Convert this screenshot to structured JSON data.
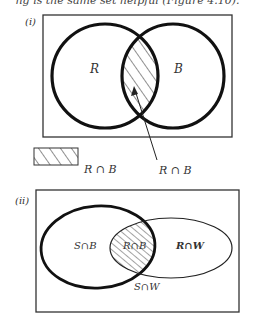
{
  "caption": "ng is the same set helpful (Figure 4.10).",
  "diagram_i": {
    "label": "(i)",
    "set_left_label": "R",
    "set_right_label": "B",
    "legend_label": "R ∩ B",
    "arrow_label": "R ∩ B"
  },
  "diagram_ii": {
    "label": "(ii)",
    "region_left_label": "S∩B",
    "region_center_label": "R∩B",
    "region_right_label": "R∩W",
    "region_bottom_label": "S∩W"
  },
  "colors": {
    "stroke": "#111111",
    "frame": "#333333",
    "text": "#333333",
    "background": "#ffffff"
  }
}
